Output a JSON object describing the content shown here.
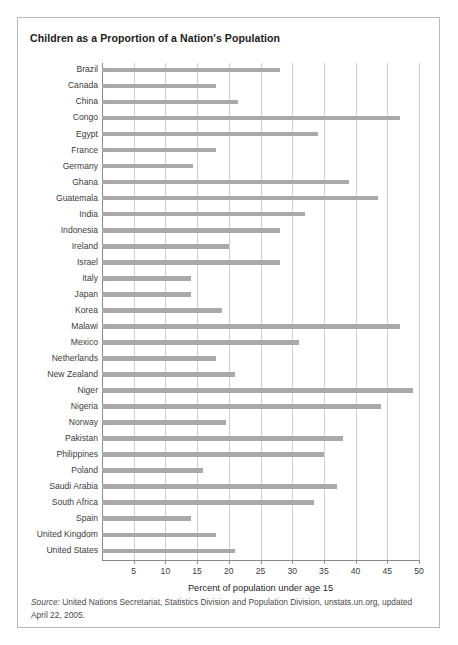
{
  "figure": {
    "title": "Children as a Proportion of a Nation's Population",
    "source_lead": "Source:",
    "source_text": " United Nations Secretariat, Statistics Division and Population Division, unstats.un.org, updated April 22, 2005."
  },
  "chart_data": {
    "type": "bar",
    "orientation": "horizontal",
    "title": "Children as a Proportion of a Nation's Population",
    "xlabel": "Percent of population under age 15",
    "ylabel": "",
    "xlim": [
      0,
      50
    ],
    "xticks": [
      5,
      10,
      15,
      20,
      25,
      30,
      35,
      40,
      45,
      50
    ],
    "xtick_labels": [
      "5",
      "10",
      "15",
      "20",
      "25",
      "30",
      "35",
      "40",
      "45",
      "50"
    ],
    "grid": "vertical",
    "legend": "none",
    "bar_color": "#a9a9a9",
    "categories": [
      "Brazil",
      "Canada",
      "China",
      "Congo",
      "Egypt",
      "France",
      "Germany",
      "Ghana",
      "Guatemala",
      "India",
      "Indonesia",
      "Ireland",
      "Israel",
      "Italy",
      "Japan",
      "Korea",
      "Malawi",
      "Mexico",
      "Netherlands",
      "New Zealand",
      "Niger",
      "Nigeria",
      "Norway",
      "Pakistan",
      "Philippines",
      "Poland",
      "Saudi Arabia",
      "South Africa",
      "Spain",
      "United Kingdom",
      "United States"
    ],
    "values": [
      28,
      18,
      21.5,
      47,
      34,
      18,
      14.4,
      39,
      43.5,
      32,
      28,
      20,
      28,
      14,
      14,
      19,
      47,
      31,
      18,
      21,
      49,
      44,
      19.5,
      38,
      35,
      16,
      37,
      33.5,
      14,
      18,
      21
    ]
  }
}
